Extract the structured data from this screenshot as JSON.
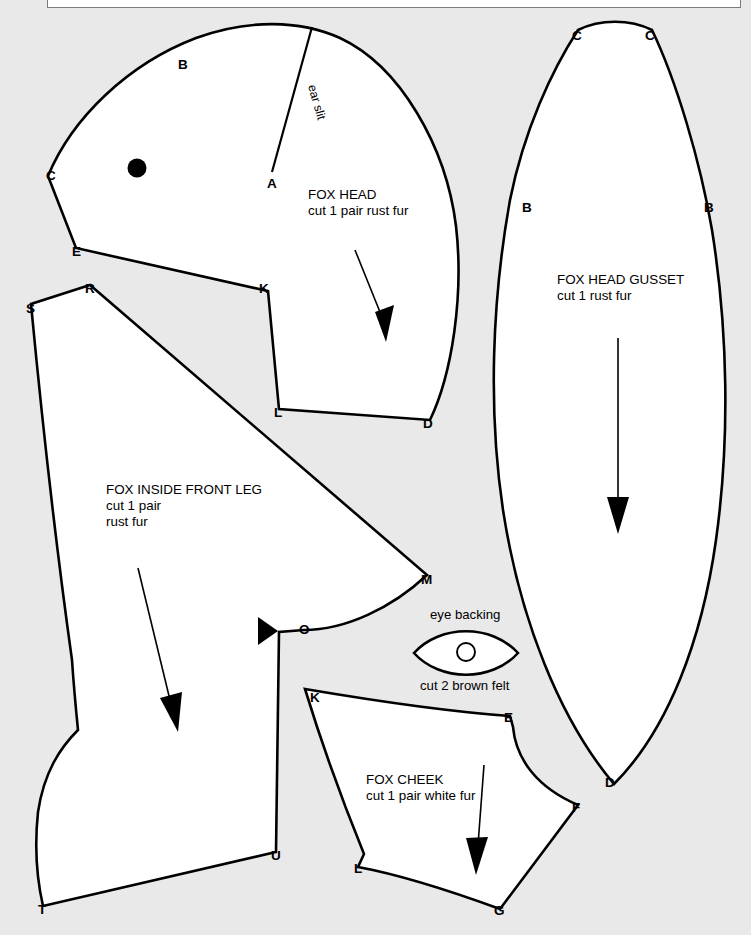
{
  "sheet": {
    "background_color": "#e9e9e9",
    "piece_fill_color": "#ffffff",
    "line_color": "#000000",
    "topbar_color": "#ffffff"
  },
  "pieces": {
    "fox_head": {
      "title": "FOX HEAD",
      "cut_note": "cut 1 pair rust fur",
      "slit_label": "ear slit",
      "vertices": [
        {
          "id": "A",
          "label": "A",
          "x": 272,
          "y": 182
        },
        {
          "id": "B",
          "label": "B",
          "x": 182,
          "y": 63
        },
        {
          "id": "C",
          "label": "C",
          "x": 48,
          "y": 173
        },
        {
          "id": "E",
          "label": "E",
          "x": 76,
          "y": 250
        },
        {
          "id": "K",
          "label": "K",
          "x": 264,
          "y": 288
        },
        {
          "id": "L",
          "label": "L",
          "x": 279,
          "y": 411
        },
        {
          "id": "D",
          "label": "D",
          "x": 428,
          "y": 422
        }
      ]
    },
    "fox_head_gusset": {
      "title": "FOX HEAD GUSSET",
      "cut_note": "cut 1 rust fur",
      "vertices": [
        {
          "id": "C-left",
          "label": "C",
          "x": 578,
          "y": 33
        },
        {
          "id": "C-right",
          "label": "C",
          "x": 650,
          "y": 33
        },
        {
          "id": "B-left",
          "label": "B",
          "x": 527,
          "y": 207
        },
        {
          "id": "B-right",
          "label": "B",
          "x": 709,
          "y": 207
        },
        {
          "id": "D",
          "label": "D",
          "x": 610,
          "y": 781
        }
      ]
    },
    "fox_inside_front_leg": {
      "title": "FOX INSIDE FRONT LEG",
      "cut_note_line1": "cut 1 pair",
      "cut_note_line2": "rust fur",
      "vertices": [
        {
          "id": "R",
          "label": "R",
          "x": 90,
          "y": 287
        },
        {
          "id": "S",
          "label": "S",
          "x": 31,
          "y": 307
        },
        {
          "id": "M",
          "label": "M",
          "x": 427,
          "y": 578
        },
        {
          "id": "O",
          "label": "O",
          "x": 304,
          "y": 630
        },
        {
          "id": "U",
          "label": "U",
          "x": 276,
          "y": 854
        },
        {
          "id": "T",
          "label": "T",
          "x": 43,
          "y": 908
        }
      ]
    },
    "eye_backing": {
      "title": "eye backing",
      "cut_note": "cut 2 brown felt"
    },
    "fox_cheek": {
      "title": "FOX CHEEK",
      "cut_note": "cut 1 pair white fur",
      "vertices": [
        {
          "id": "K",
          "label": "K",
          "x": 314,
          "y": 697
        },
        {
          "id": "E",
          "label": "E",
          "x": 509,
          "y": 717
        },
        {
          "id": "F",
          "label": "F",
          "x": 577,
          "y": 806
        },
        {
          "id": "G",
          "label": "G",
          "x": 499,
          "y": 910
        },
        {
          "id": "L",
          "label": "L",
          "x": 359,
          "y": 868
        }
      ]
    }
  }
}
